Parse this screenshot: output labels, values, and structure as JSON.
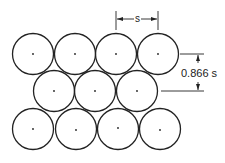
{
  "diagram": {
    "type": "hexagonal-packing",
    "rows": [
      {
        "y": 54,
        "centers_x": [
          33,
          75,
          116,
          158
        ]
      },
      {
        "y": 91,
        "centers_x": [
          54,
          95,
          137
        ]
      },
      {
        "y": 129,
        "centers_x": [
          33,
          76,
          118,
          160
        ]
      }
    ],
    "radius": 20.5,
    "labels": {
      "spacing": "s",
      "row_spacing": "0.866 s"
    },
    "colors": {
      "stroke": "#222222",
      "background": "#ffffff"
    }
  }
}
